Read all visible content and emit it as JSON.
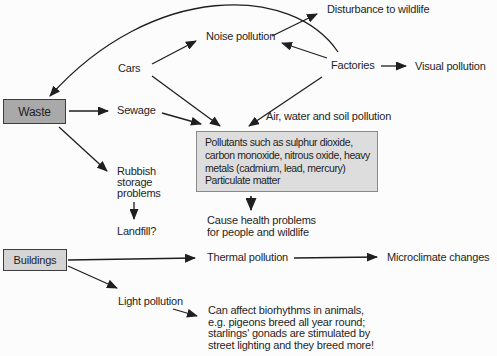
{
  "colors": {
    "background": "#fcfcfc",
    "line": "#1f1f1f",
    "box_border": "#3d3d3d",
    "waste_box_fill": "#a9a9a9",
    "buildings_box_fill": "#d4d4d4",
    "pollutants_box_fill": "#dddddd"
  },
  "boxes": {
    "waste": "Waste",
    "buildings": "Buildings",
    "pollutants": "Pollutants such as sulphur dioxide,\ncarbon monoxide, nitrous oxide, heavy\nmetals (cadmium, lead, mercury)\nParticulate matter"
  },
  "labels": {
    "cars": "Cars",
    "factories": "Factories",
    "sewage": "Sewage",
    "noise_pollution": "Noise pollution",
    "disturbance": "Disturbance to wildlife",
    "visual_pollution": "Visual pollution",
    "air_water_soil": "Air, water and soil pollution",
    "rubbish": "Rubbish\nstorage\nproblems",
    "landfill": "Landfill?",
    "cause_health": "Cause health problems\nfor people and wildlife",
    "thermal_pollution": "Thermal pollution",
    "microclimate": "Microclimate changes",
    "light_pollution": "Light pollution",
    "biorhythms": "Can affect biorhythms in animals,\ne.g. pigeons breed all year round;\nstarlings' gonads are stimulated by\nstreet lighting and they breed more!"
  },
  "edges": [
    {
      "from": "Factories",
      "to": "Waste"
    },
    {
      "from": "Waste",
      "to": "Sewage"
    },
    {
      "from": "Waste",
      "to": "Rubbish storage problems"
    },
    {
      "from": "Rubbish storage problems",
      "to": "Landfill?"
    },
    {
      "from": "Cars",
      "to": "Noise pollution"
    },
    {
      "from": "Cars",
      "to": "Pollutants box"
    },
    {
      "from": "Sewage",
      "to": "Pollutants box"
    },
    {
      "from": "Factories",
      "to": "Noise pollution"
    },
    {
      "from": "Factories",
      "to": "Pollutants box",
      "label": "Air, water and soil pollution"
    },
    {
      "from": "Factories",
      "to": "Visual pollution"
    },
    {
      "from": "Noise pollution",
      "to": "Disturbance to wildlife"
    },
    {
      "from": "Pollutants box",
      "to": "Cause health problems"
    },
    {
      "from": "Buildings",
      "to": "Thermal pollution"
    },
    {
      "from": "Thermal pollution",
      "to": "Microclimate changes"
    },
    {
      "from": "Buildings",
      "to": "Light pollution"
    },
    {
      "from": "Light pollution",
      "to": "Biorhythms note"
    }
  ]
}
